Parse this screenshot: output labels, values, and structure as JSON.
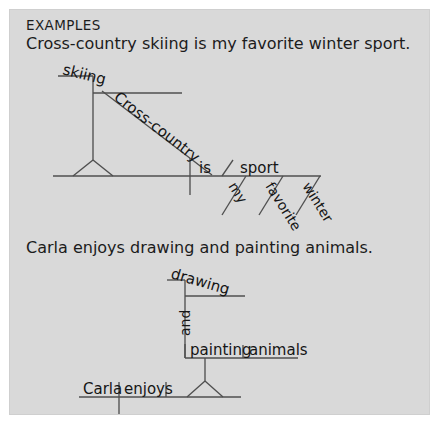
{
  "page": {
    "background_color": "#ffffff",
    "panel_color": "#d9d9d9",
    "line_color": "#4f4f4f",
    "text_color": "#1c1c1c"
  },
  "heading": "EXAMPLES",
  "examples": [
    {
      "sentence": "Cross-country skiing is my favorite winter sport.",
      "diagram_labels": {
        "gerund": "skiing",
        "gerund_modifier": "Cross-country",
        "verb": "is",
        "predicate_noun": "sport",
        "modifier_1": "my",
        "modifier_2": "favorite",
        "modifier_3": "winter"
      }
    },
    {
      "sentence": "Carla enjoys drawing and painting animals.",
      "diagram_labels": {
        "gerund_1": "drawing",
        "conjunction": "and",
        "gerund_2": "painting",
        "gerund_object": "animals",
        "subject": "Carla",
        "verb": "enjoys"
      }
    }
  ]
}
